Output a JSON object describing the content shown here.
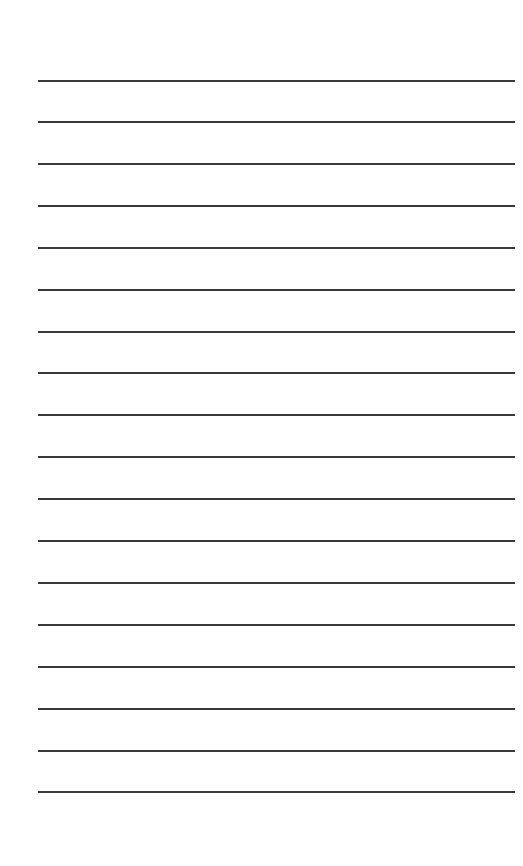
{
  "page": {
    "type": "lined-paper",
    "background_color": "#ffffff",
    "line_color": "#3a3a3a",
    "line_count": 18,
    "line_positions_y": [
      81,
      122,
      164,
      206,
      248,
      290,
      332,
      373,
      415,
      457,
      499,
      541,
      583,
      625,
      667,
      709,
      751,
      792
    ],
    "line_left_x": 38,
    "line_right_x": 515,
    "line_thickness": 2
  }
}
